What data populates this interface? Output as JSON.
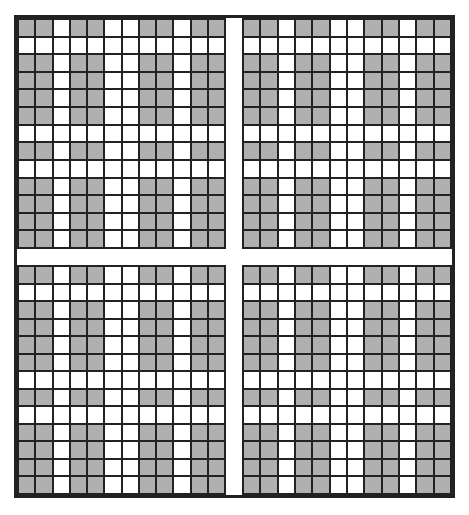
{
  "diagram": {
    "type": "grid-pattern",
    "colors": {
      "fill": "#b0b0b0",
      "empty": "#ffffff",
      "line": "#222222",
      "background": "#ffffff"
    },
    "quadrant_layout": {
      "rows": 2,
      "cols": 2
    },
    "column_pattern": [
      "G",
      "G",
      "W",
      "G",
      "G",
      "W",
      "W",
      "G",
      "G",
      "W",
      "G",
      "G"
    ],
    "row_pattern": [
      "G",
      "W",
      "G",
      "G",
      "G",
      "G",
      "W",
      "G",
      "W",
      "G",
      "G",
      "G",
      "G"
    ],
    "rule": "cell is gray when both its row and its column are gray",
    "quadrants": [
      {
        "name": "top-left",
        "left": 0,
        "top": 0,
        "width": 209,
        "height": 231
      },
      {
        "name": "top-right",
        "left": 225,
        "top": 0,
        "width": 210,
        "height": 231
      },
      {
        "name": "bottom-left",
        "left": 0,
        "top": 247,
        "width": 209,
        "height": 230
      },
      {
        "name": "bottom-right",
        "left": 225,
        "top": 247,
        "width": 210,
        "height": 230
      }
    ]
  }
}
